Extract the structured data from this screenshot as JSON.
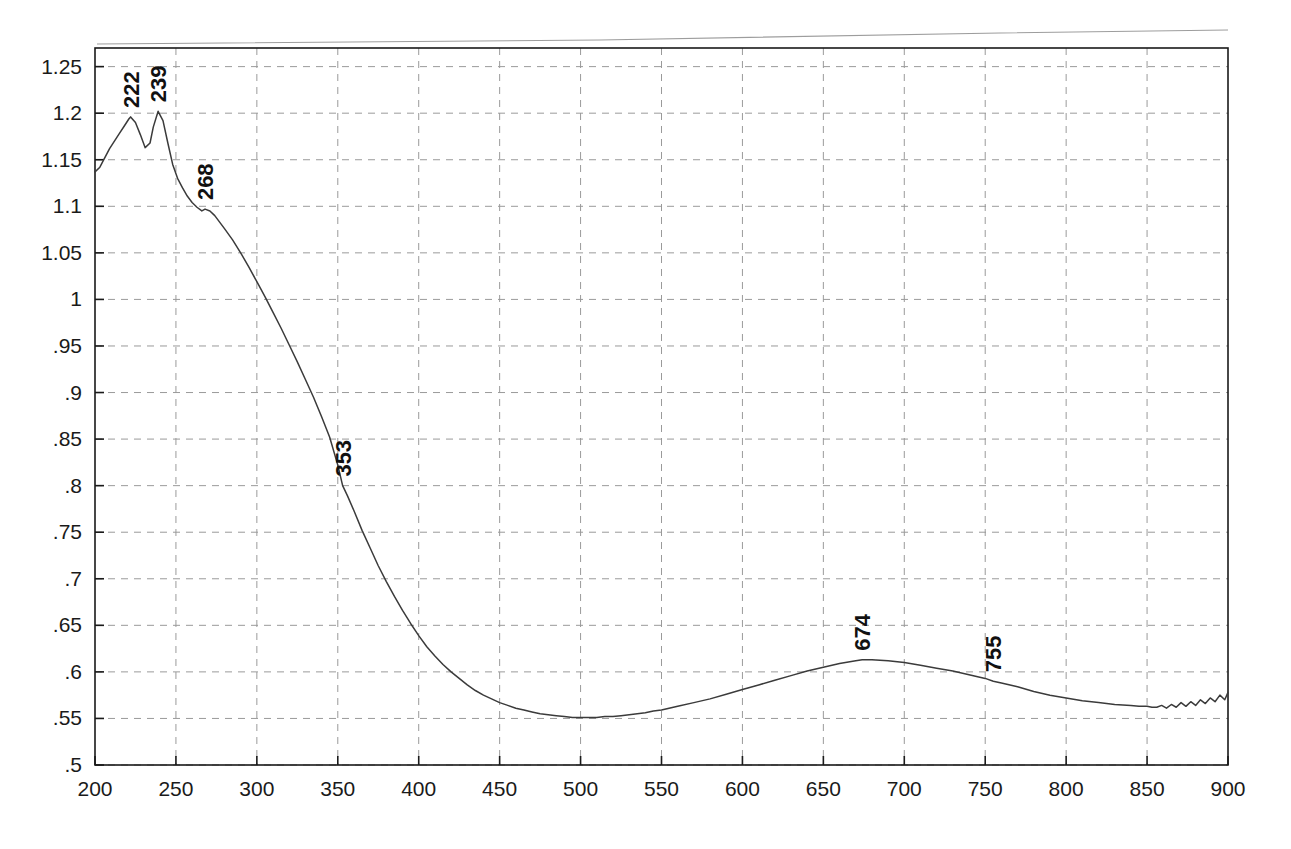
{
  "chart_data": {
    "type": "line",
    "title": "",
    "xlabel": "",
    "ylabel": "",
    "xlim": [
      200,
      900
    ],
    "ylim": [
      0.5,
      1.27
    ],
    "grid": true,
    "legend": null,
    "x_ticks": [
      "200",
      "250",
      "300",
      "350",
      "400",
      "450",
      "500",
      "550",
      "600",
      "650",
      "700",
      "750",
      "800",
      "850",
      "900"
    ],
    "x_tick_values": [
      200,
      250,
      300,
      350,
      400,
      450,
      500,
      550,
      600,
      650,
      700,
      750,
      800,
      850,
      900
    ],
    "y_ticks": [
      ".5",
      ".55",
      ".6",
      ".65",
      ".7",
      ".75",
      ".8",
      ".85",
      ".9",
      ".95",
      "1",
      "1.05",
      "1.1",
      "1.15",
      "1.2",
      "1.25"
    ],
    "y_tick_values": [
      0.5,
      0.55,
      0.6,
      0.65,
      0.7,
      0.75,
      0.8,
      0.85,
      0.9,
      0.95,
      1.0,
      1.05,
      1.1,
      1.15,
      1.2,
      1.25
    ],
    "line_color": "#3b3b3b",
    "grid_color": "#9a9a9a",
    "axis_color": "#1a1a1a",
    "annotations": [
      {
        "label": "222",
        "x": 222,
        "y": 1.196
      },
      {
        "label": "239",
        "x": 239,
        "y": 1.202
      },
      {
        "label": "268",
        "x": 268,
        "y": 1.097
      },
      {
        "label": "353",
        "x": 353,
        "y": 0.8
      },
      {
        "label": "674",
        "x": 674,
        "y": 0.613
      },
      {
        "label": "755",
        "x": 755,
        "y": 0.59
      }
    ],
    "x": [
      200,
      203,
      206,
      209,
      212,
      215,
      218,
      221,
      222,
      225,
      228,
      231,
      234,
      236,
      239,
      242,
      245,
      248,
      251,
      254,
      257,
      260,
      263,
      266,
      268,
      271,
      274,
      277,
      280,
      285,
      290,
      295,
      300,
      305,
      310,
      315,
      320,
      325,
      330,
      335,
      340,
      345,
      350,
      353,
      356,
      360,
      365,
      370,
      375,
      380,
      385,
      390,
      395,
      400,
      405,
      410,
      415,
      420,
      425,
      430,
      435,
      440,
      445,
      450,
      455,
      460,
      465,
      470,
      475,
      480,
      485,
      490,
      495,
      500,
      505,
      510,
      515,
      520,
      525,
      530,
      535,
      540,
      545,
      550,
      560,
      570,
      580,
      590,
      600,
      610,
      620,
      630,
      640,
      650,
      660,
      670,
      674,
      680,
      690,
      700,
      710,
      720,
      730,
      740,
      750,
      755,
      760,
      770,
      780,
      790,
      800,
      810,
      820,
      830,
      840,
      845,
      850,
      853,
      856,
      859,
      862,
      865,
      868,
      871,
      874,
      877,
      880,
      883,
      886,
      889,
      892,
      895,
      898,
      900
    ],
    "y": [
      1.137,
      1.142,
      1.152,
      1.162,
      1.17,
      1.178,
      1.186,
      1.194,
      1.196,
      1.19,
      1.177,
      1.163,
      1.168,
      1.185,
      1.202,
      1.192,
      1.168,
      1.145,
      1.13,
      1.12,
      1.111,
      1.104,
      1.099,
      1.095,
      1.097,
      1.095,
      1.09,
      1.083,
      1.076,
      1.064,
      1.05,
      1.035,
      1.019,
      1.003,
      0.986,
      0.969,
      0.951,
      0.933,
      0.914,
      0.895,
      0.874,
      0.852,
      0.822,
      0.8,
      0.789,
      0.773,
      0.752,
      0.733,
      0.714,
      0.697,
      0.681,
      0.666,
      0.652,
      0.639,
      0.627,
      0.617,
      0.608,
      0.6,
      0.593,
      0.586,
      0.58,
      0.575,
      0.571,
      0.567,
      0.564,
      0.561,
      0.559,
      0.557,
      0.555,
      0.554,
      0.553,
      0.552,
      0.551,
      0.551,
      0.551,
      0.551,
      0.552,
      0.552,
      0.553,
      0.554,
      0.555,
      0.556,
      0.558,
      0.559,
      0.563,
      0.567,
      0.571,
      0.576,
      0.581,
      0.586,
      0.591,
      0.596,
      0.601,
      0.605,
      0.609,
      0.612,
      0.613,
      0.613,
      0.612,
      0.61,
      0.607,
      0.604,
      0.601,
      0.597,
      0.593,
      0.59,
      0.588,
      0.584,
      0.579,
      0.575,
      0.572,
      0.569,
      0.567,
      0.565,
      0.564,
      0.563,
      0.563,
      0.562,
      0.562,
      0.564,
      0.561,
      0.565,
      0.562,
      0.567,
      0.563,
      0.568,
      0.564,
      0.57,
      0.566,
      0.572,
      0.568,
      0.575,
      0.57,
      0.578,
      0.572,
      0.574
    ]
  }
}
